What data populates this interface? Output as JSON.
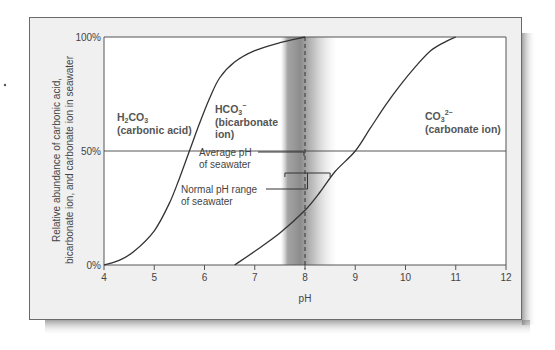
{
  "chart_data": {
    "type": "line",
    "title": "",
    "xlabel": "pH",
    "ylabel_lines": [
      "Relative abundance of carbonic acid,",
      "bicarbonate ion, and carbonate ion in seawater"
    ],
    "xlim": [
      4,
      12
    ],
    "ylim": [
      0,
      100
    ],
    "x_ticks": [
      4,
      5,
      6,
      7,
      8,
      9,
      10,
      11,
      12
    ],
    "x_tick_labels": [
      "4",
      "5",
      "6",
      "7",
      "8",
      "9",
      "10",
      "11",
      "12"
    ],
    "y_ticks": [
      0,
      50,
      100
    ],
    "y_tick_labels": [
      "0%",
      "50%",
      "100%"
    ],
    "reference_lines": {
      "horizontal_50": 50,
      "average_ph": 8.0
    },
    "normal_ph_range": [
      7.6,
      8.5
    ],
    "shaded_band": [
      7.6,
      8.6
    ],
    "series": [
      {
        "name": "H2CO3 / HCO3- boundary",
        "x": [
          4.0,
          4.3,
          4.6,
          5.0,
          5.3,
          5.5,
          5.7,
          5.9,
          6.1,
          6.3,
          6.6,
          7.0,
          7.5,
          8.0
        ],
        "y": [
          0,
          2,
          6,
          15,
          27,
          38,
          50,
          62,
          73,
          82,
          89,
          94,
          97.5,
          100
        ]
      },
      {
        "name": "HCO3- / CO3 2- boundary",
        "x": [
          6.6,
          7.0,
          7.5,
          8.0,
          8.3,
          8.6,
          9.0,
          9.3,
          9.6,
          9.9,
          10.2,
          10.5,
          10.8,
          11.0
        ],
        "y": [
          0,
          6,
          14,
          24,
          32,
          41,
          50,
          60,
          70,
          79,
          87,
          94,
          98,
          100
        ]
      }
    ],
    "region_labels": [
      {
        "formula_main": "H",
        "formula_sub": "2",
        "formula_rest": "CO",
        "formula_sub2": "3",
        "formula_sup": "",
        "name": "(carbonic acid)"
      },
      {
        "formula_main": "HCO",
        "formula_sub": "3",
        "formula_sup": "−",
        "name_line1": "(bicarbonate",
        "name_line2": "ion)"
      },
      {
        "formula_main": "CO",
        "formula_sub": "3",
        "formula_sup": "2−",
        "name": "(carbonate ion)"
      }
    ],
    "annotations": {
      "average_ph": [
        "Average pH",
        "of seawater"
      ],
      "normal_range": [
        "Normal pH range",
        "of seawater"
      ]
    }
  }
}
